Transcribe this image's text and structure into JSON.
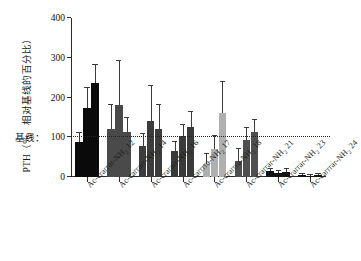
{
  "figure": {
    "ylabel": "PTH（%，相对基线的百分比）",
    "baseline_tag": "基线：",
    "baseline_value": "100"
  },
  "chart_data": {
    "type": "bar",
    "title": "",
    "xlabel": "",
    "ylabel": "PTH（%，相对基线的百分比）",
    "ylim": [
      0,
      400
    ],
    "yticks": [
      0,
      100,
      200,
      300,
      400
    ],
    "ytick_labels": [
      "0",
      "100",
      "200",
      "300",
      "400"
    ],
    "grid": false,
    "legend": "none",
    "annotations": [
      {
        "text": "基线：100",
        "y": 100,
        "style": "dotted horizontal reference line"
      }
    ],
    "categories": [
      "Ac-crarrar-NH2 12",
      "Ac-carrarr-NH2 14",
      "Ac-crararr-NH2 16",
      "Ac-carrrra-NH2 17",
      "Ac-crarrra-NH2 18",
      "Ac-crarrar-NH2 21",
      "Ac-crarrar-NH2 23",
      "Ac-carrrar-NH2 24"
    ],
    "category_labels_html": [
      "Ac-crarrar-NH<sub>2</sub> 12",
      "Ac-carrarr-NH<sub>2</sub> 14",
      "Ac-crararr-NH<sub>2</sub> 16",
      "Ac-carrrra-NH<sub>2</sub> 17",
      "Ac-crarrra-NH<sub>2</sub> 18",
      "Ac-crarrar-NH<sub>2</sub> 21",
      "Ac-crarrar-NH<sub>2</sub> 23",
      "Ac-carrrar-NH<sub>2</sub> 24"
    ],
    "series": [
      {
        "name": "bar-1",
        "values": [
          88,
          122,
          77,
          66,
          33,
          41,
          14,
          4
        ]
      },
      {
        "name": "bar-2",
        "values": [
          173,
          182,
          140,
          104,
          70,
          92,
          11,
          3
        ]
      },
      {
        "name": "bar-3",
        "values": [
          236,
          114,
          122,
          125,
          160,
          114,
          13,
          5
        ]
      }
    ],
    "errors": [
      {
        "name": "bar-1",
        "values": [
          22,
          60,
          30,
          22,
          25,
          30,
          6,
          3
        ]
      },
      {
        "name": "bar-2",
        "values": [
          52,
          110,
          88,
          26,
          33,
          32,
          5,
          3
        ]
      },
      {
        "name": "bar-3",
        "values": [
          46,
          35,
          60,
          38,
          78,
          30,
          6,
          3
        ]
      }
    ],
    "bar_colors": [
      "#0a0a0a",
      "#4a4a4a",
      "#3c3c3c",
      "#3a3a3a",
      "#b0b0b0",
      "#4f4f4f",
      "#141414",
      "#141414"
    ],
    "group_colors_note": "each category group shares one fill tone"
  },
  "colors": {
    "axis": "#2b2b2b",
    "text": "#111111",
    "error_bar": "#3a3a3a",
    "baseline_line": "#222222"
  }
}
